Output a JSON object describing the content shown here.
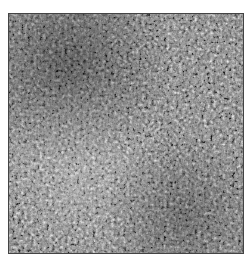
{
  "image": {
    "description": "grayscale micrograph texture",
    "background_color": "#ffffff",
    "border_color": "#444444",
    "tones": {
      "dark": "#1a1a1a",
      "mid": "#7a7a7a",
      "light": "#e6e6e6"
    }
  }
}
